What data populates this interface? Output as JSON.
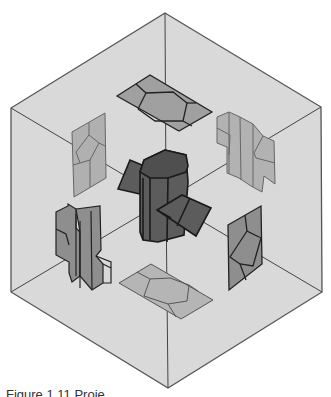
{
  "figure": {
    "caption": "Figure 1.11  Proje"
  },
  "colors": {
    "background": "#ffffff",
    "cube_face": "#d9d9d9",
    "cube_edge": "#555555",
    "projection_fill": "#a8a8a8",
    "projection_dark_fill": "#8c8c8c",
    "solid_fill": "#5a5a5a",
    "solid_edge": "#1a1a1a"
  },
  "diagram": {
    "views": [
      "top",
      "bottom",
      "left-upper",
      "left-lower",
      "right-upper",
      "right-lower"
    ]
  }
}
